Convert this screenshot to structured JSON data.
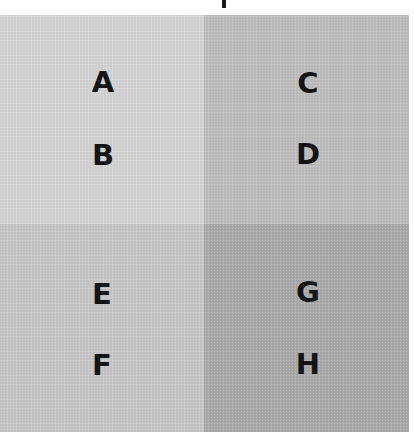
{
  "figure": {
    "quadrants": [
      {
        "id": "top-left",
        "color": "#d2d2d2",
        "labels": [
          "A",
          "B"
        ]
      },
      {
        "id": "top-right",
        "color": "#bdbdbd",
        "labels": [
          "C",
          "D"
        ]
      },
      {
        "id": "bottom-left",
        "color": "#c6c6c6",
        "labels": [
          "E",
          "F"
        ]
      },
      {
        "id": "bottom-right",
        "color": "#a9a9a9",
        "labels": [
          "G",
          "H"
        ]
      }
    ]
  }
}
